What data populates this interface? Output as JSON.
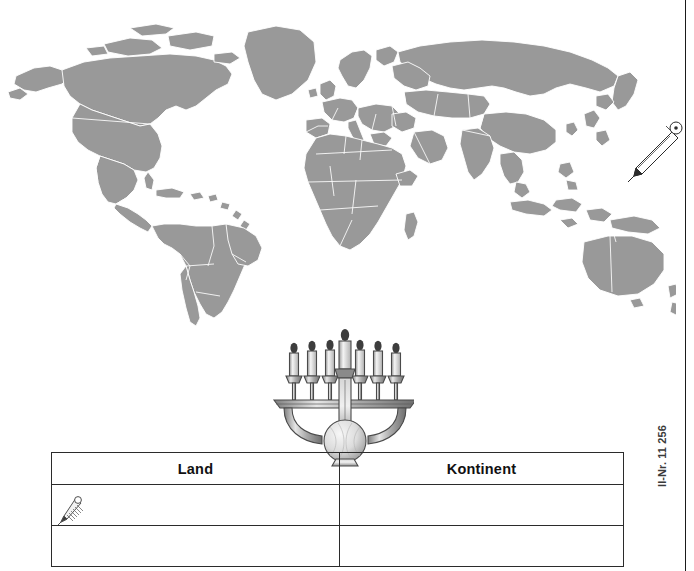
{
  "page": {
    "kind": "worksheet-page",
    "background_color": "#ffffff",
    "margin_rule_color": "#1a1a1a"
  },
  "article_number": {
    "text": "ll-Nr. 11 256",
    "orientation": "vertical-bottom-to-top",
    "color": "#3a3a3a"
  },
  "map": {
    "name": "world-map",
    "title": "Weltkarte",
    "land_fill": "#999999",
    "border_stroke": "#ffffff",
    "ocean_fill": "#ffffff",
    "projection": "equirectangular"
  },
  "illustrations": [
    {
      "name": "pencil-large-icon",
      "label": "Bleistift",
      "position": "pacific-ocean",
      "color": "#2b2b2b"
    },
    {
      "name": "menorah-icon",
      "label": "Menora",
      "candle_count": 7,
      "color": "#8c8c8c"
    },
    {
      "name": "pencil-small-icon",
      "label": "Bleistift klein",
      "position": "table-row-1-land",
      "color": "#5a5a5a"
    }
  ],
  "table": {
    "name": "answer-table",
    "columns": [
      {
        "key": "land",
        "header": "Land"
      },
      {
        "key": "kontinent",
        "header": "Kontinent"
      }
    ],
    "rows": [
      {
        "land": "",
        "kontinent": ""
      },
      {
        "land": "",
        "kontinent": ""
      }
    ],
    "border_color": "#2b2b2b",
    "header_font_weight": "bold"
  }
}
